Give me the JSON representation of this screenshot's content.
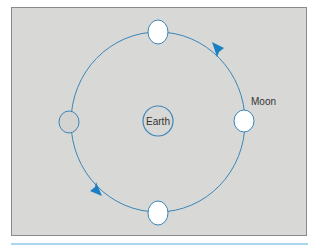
{
  "diagram": {
    "type": "moon-orbit",
    "labels": {
      "earth": "Earth",
      "moon": "Moon"
    },
    "colors": {
      "panel_background": "#d8d8d6",
      "panel_border": "#8a8a8a",
      "orbit": "#3a86b8",
      "arrow": "#1b7fc4",
      "moon_lit": "#ffffff",
      "moon_dark": "#d0d0ce",
      "bottom_rule": "#a9d6ef"
    },
    "orbit": {
      "cx": 158,
      "cy": 122,
      "rx": 87,
      "ry": 90,
      "direction": "counter-clockwise"
    },
    "earth": {
      "cx": 158,
      "cy": 121,
      "r": 15
    },
    "moons": [
      {
        "position": "top",
        "cx": 158,
        "cy": 32,
        "phase": "lit"
      },
      {
        "position": "right",
        "cx": 244,
        "cy": 121,
        "phase": "lit",
        "labeled": true
      },
      {
        "position": "bottom",
        "cx": 158,
        "cy": 213,
        "phase": "lit"
      },
      {
        "position": "left",
        "cx": 69,
        "cy": 122,
        "phase": "dark"
      }
    ],
    "arrows": [
      {
        "position": "upper-right",
        "x": 220,
        "y": 49,
        "pointing": "up-left"
      },
      {
        "position": "lower-left",
        "x": 96,
        "y": 188,
        "pointing": "down-right"
      }
    ]
  }
}
